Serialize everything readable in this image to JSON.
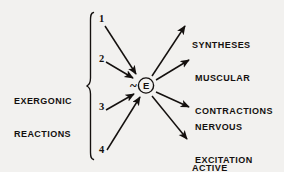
{
  "figure": {
    "background_color": "#f2f1ef",
    "ink_color": "#14100e",
    "group_label_line1": "EXERGONIC",
    "group_label_line2": "REACTIONS",
    "center_node": {
      "symbol": "E",
      "prefix": "~",
      "shape": "circle"
    },
    "inputs": [
      {
        "number": "1"
      },
      {
        "number": "2"
      },
      {
        "number": "3"
      },
      {
        "number": "4"
      }
    ],
    "outputs": [
      {
        "line1": "SYNTHESES",
        "line2": ""
      },
      {
        "line1": "MUSCULAR",
        "line2": "CONTRACTIONS"
      },
      {
        "line1": "NERVOUS",
        "line2": "EXCITATION"
      },
      {
        "line1": "ACTIVE",
        "line2": "TRANSPORT"
      }
    ]
  }
}
